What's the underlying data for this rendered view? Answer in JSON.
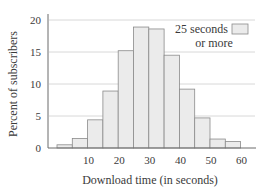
{
  "chart_data": {
    "type": "bar",
    "title": "",
    "xlabel": "Download time (in seconds)",
    "ylabel": "Percent of subscribers",
    "bin_width": 5,
    "bins": [
      [
        0,
        5
      ],
      [
        5,
        10
      ],
      [
        10,
        15
      ],
      [
        15,
        20
      ],
      [
        20,
        25
      ],
      [
        25,
        30
      ],
      [
        30,
        35
      ],
      [
        35,
        40
      ],
      [
        40,
        45
      ],
      [
        45,
        50
      ],
      [
        50,
        55
      ],
      [
        55,
        60
      ]
    ],
    "categories": [
      "0-5",
      "5-10",
      "10-15",
      "15-20",
      "20-25",
      "25-30",
      "30-35",
      "35-40",
      "40-45",
      "45-50",
      "50-55",
      "55-60"
    ],
    "values": [
      0.5,
      1.5,
      4.4,
      8.9,
      15.2,
      18.9,
      18.6,
      14.5,
      9.2,
      4.7,
      1.4,
      1.0
    ],
    "xlim": [
      0,
      62
    ],
    "ylim": [
      0,
      20
    ],
    "xticks": [
      10,
      20,
      30,
      40,
      50,
      60
    ],
    "yticks": [
      0,
      5,
      10,
      15,
      20
    ],
    "grid": "horizontal",
    "legend": {
      "position": "top-right",
      "entries": [
        {
          "label_line1": "25 seconds",
          "label_line2": "or more"
        }
      ]
    }
  },
  "colors": {
    "bar_fill": "#ebebeb",
    "bar_stroke": "#8a8a8a",
    "grid": "#d8d8d8",
    "axis": "#6a6a6a",
    "text": "#3a3a3a"
  },
  "labels": {
    "ylabel": "Percent of subscribers",
    "xlabel": "Download time (in seconds)",
    "legend_line1": "25 seconds",
    "legend_line2": "or more"
  }
}
